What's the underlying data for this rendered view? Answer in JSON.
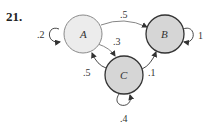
{
  "problem_number": "21.",
  "diagram": {
    "type": "markov-chain-state-diagram",
    "nodes": [
      {
        "id": "A",
        "label": "A",
        "fill": "#ececec",
        "stroke": "#8a8a8a"
      },
      {
        "id": "B",
        "label": "B",
        "fill": "#d6d6d6",
        "stroke": "#333333"
      },
      {
        "id": "C",
        "label": "C",
        "fill": "#d6d6d6",
        "stroke": "#333333"
      }
    ],
    "edges": [
      {
        "from": "A",
        "to": "A",
        "label": ".2"
      },
      {
        "from": "A",
        "to": "B",
        "label": ".5"
      },
      {
        "from": "A",
        "to": "C",
        "label": ".3"
      },
      {
        "from": "B",
        "to": "B",
        "label": "1"
      },
      {
        "from": "C",
        "to": "A",
        "label": ".5"
      },
      {
        "from": "C",
        "to": "B",
        "label": ".1"
      },
      {
        "from": "C",
        "to": "C",
        "label": ".4"
      }
    ]
  }
}
